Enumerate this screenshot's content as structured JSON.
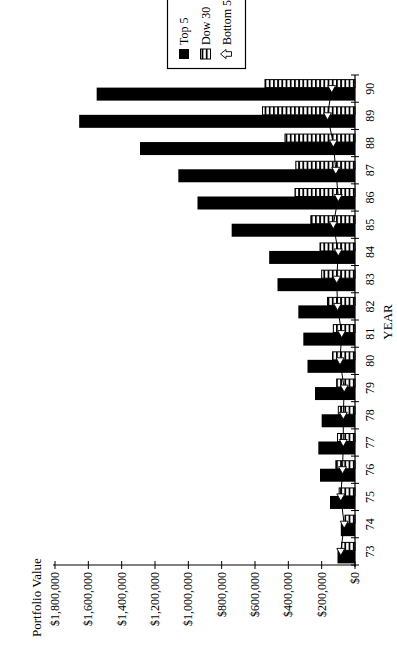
{
  "page": {
    "background": "#ffffff",
    "ink": "#000000"
  },
  "chart_data": {
    "type": "bar",
    "orientation_note": "landscape grouped bar chart printed rotated 90 degrees counter-clockwise on a portrait page",
    "title": "",
    "xlabel": "YEAR",
    "ylabel": "Portfolio Value",
    "categories": [
      "73",
      "74",
      "75",
      "76",
      "77",
      "78",
      "79",
      "80",
      "81",
      "82",
      "83",
      "84",
      "85",
      "86",
      "87",
      "88",
      "89",
      "90"
    ],
    "series": [
      {
        "name": "Top 5",
        "type": "bar",
        "style": "solid-black",
        "values": [
          105000,
          85000,
          150000,
          210000,
          220000,
          200000,
          240000,
          285000,
          310000,
          340000,
          465000,
          515000,
          740000,
          945000,
          1060000,
          1290000,
          1655000,
          1550000
        ]
      },
      {
        "name": "Dow 30",
        "type": "bar",
        "style": "striped",
        "values": [
          80000,
          60000,
          95000,
          115000,
          105000,
          100000,
          110000,
          135000,
          130000,
          165000,
          200000,
          210000,
          265000,
          360000,
          355000,
          420000,
          555000,
          540000
        ]
      },
      {
        "name": "Bottom 5",
        "type": "line",
        "style": "open-marker-line",
        "values": [
          85000,
          65000,
          85000,
          75000,
          70000,
          70000,
          65000,
          90000,
          80000,
          105000,
          110000,
          100000,
          130000,
          100000,
          115000,
          130000,
          165000,
          140000
        ]
      }
    ],
    "ylim": [
      0,
      1800000
    ],
    "ytick_step": 200000,
    "ytick_labels": [
      "$0",
      "$200,000",
      "$400,000",
      "$600,000",
      "$800,000",
      "$1,000,000",
      "$1,200,000",
      "$1,400,000",
      "$1,600,000",
      "$1,800,000"
    ],
    "grid": false,
    "legend_position": "right-middle, partially clipped by page edge",
    "legend_entries": [
      "Top 5",
      "Dow 30",
      "Bottom 5"
    ]
  }
}
